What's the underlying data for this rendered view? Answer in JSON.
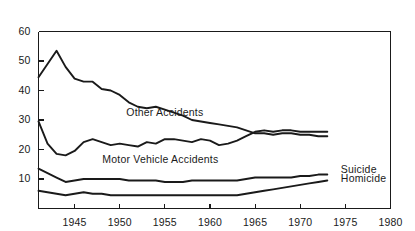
{
  "chart_data": {
    "type": "line",
    "title": "",
    "subtitle": "",
    "xlabel": "",
    "ylabel": "",
    "xlim": [
      1941,
      1980
    ],
    "ylim": [
      0,
      60
    ],
    "grid": false,
    "legend_position": "inline-annotations",
    "xticks": [
      1945,
      1950,
      1955,
      1960,
      1965,
      1970,
      1975,
      1980
    ],
    "xtick_labels": [
      "1945",
      "1950",
      "1955",
      "1960",
      "1965",
      "1970",
      "1975",
      "1980"
    ],
    "yticks": [
      10,
      20,
      30,
      40,
      50,
      60
    ],
    "ytick_labels": [
      "10",
      "20",
      "30",
      "40",
      "50",
      "60"
    ],
    "x": [
      1941,
      1942,
      1943,
      1944,
      1945,
      1946,
      1947,
      1948,
      1949,
      1950,
      1951,
      1952,
      1953,
      1954,
      1955,
      1956,
      1957,
      1958,
      1959,
      1960,
      1961,
      1962,
      1963,
      1964,
      1965,
      1966,
      1967,
      1968,
      1969,
      1970,
      1971,
      1972,
      1973
    ],
    "series": [
      {
        "name": "Other Accidents",
        "label": "Other Accidents",
        "values": [
          44.5,
          49.0,
          53.5,
          48.0,
          44.0,
          43.0,
          43.0,
          40.5,
          40.0,
          38.5,
          36.0,
          34.5,
          34.0,
          34.5,
          33.5,
          32.5,
          31.5,
          30.0,
          29.5,
          29.0,
          28.5,
          28.0,
          27.5,
          26.5,
          25.5,
          25.5,
          25.0,
          25.5,
          25.5,
          25.0,
          25.0,
          24.5,
          24.5
        ]
      },
      {
        "name": "Motor Vehicle Accidents",
        "label": "Motor Vehicle Accidents",
        "values": [
          29.5,
          22.0,
          18.5,
          18.0,
          19.5,
          22.5,
          23.5,
          22.5,
          21.5,
          22.0,
          21.5,
          21.0,
          22.5,
          22.0,
          23.5,
          23.5,
          23.0,
          22.5,
          23.5,
          23.0,
          21.5,
          22.0,
          23.0,
          24.5,
          26.0,
          26.5,
          26.0,
          26.5,
          26.5,
          26.0,
          26.0,
          26.0,
          26.0
        ]
      },
      {
        "name": "Suicide",
        "label": "Suicide",
        "values": [
          13.5,
          12.0,
          10.5,
          9.0,
          9.5,
          10.0,
          10.0,
          10.0,
          10.0,
          10.0,
          9.5,
          9.5,
          9.5,
          9.5,
          9.0,
          9.0,
          9.0,
          9.5,
          9.5,
          9.5,
          9.5,
          9.5,
          9.5,
          10.0,
          10.5,
          10.5,
          10.5,
          10.5,
          10.5,
          11.0,
          11.0,
          11.5,
          11.5
        ]
      },
      {
        "name": "Homicide",
        "label": "Homicide",
        "values": [
          6.0,
          5.5,
          5.0,
          4.5,
          5.0,
          5.5,
          5.0,
          5.0,
          4.5,
          4.5,
          4.5,
          4.5,
          4.5,
          4.5,
          4.5,
          4.5,
          4.5,
          4.5,
          4.5,
          4.5,
          4.5,
          4.5,
          4.5,
          5.0,
          5.5,
          6.0,
          6.5,
          7.0,
          7.5,
          8.0,
          8.5,
          9.0,
          9.5
        ]
      }
    ],
    "annotations": [
      {
        "text": "Other Accidents",
        "x": 1955.0,
        "y": 32.5,
        "name": "other-accidents-label"
      },
      {
        "text": "Motor Vehicle Accidents",
        "x": 1954.5,
        "y": 16.5,
        "name": "motor-vehicle-accidents-label"
      },
      {
        "text": "Suicide",
        "x": 1974.5,
        "y": 13.0,
        "name": "suicide-label"
      },
      {
        "text": "Homicide",
        "x": 1974.5,
        "y": 10.0,
        "name": "homicide-label"
      }
    ],
    "line_color": "#1a1a1a",
    "axis_color": "#1a1a1a",
    "background_color": "#ffffff"
  }
}
